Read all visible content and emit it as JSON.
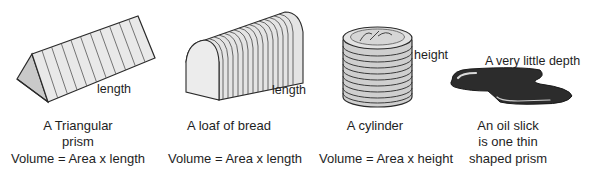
{
  "shapes": [
    {
      "id": "triangular-prism",
      "dimension_label": "length",
      "caption_lines": [
        "A Triangular",
        "prism"
      ],
      "formula": "Volume = Area x length"
    },
    {
      "id": "loaf-of-bread",
      "dimension_label": "length",
      "caption_lines": [
        "A loaf of bread"
      ],
      "formula": "Volume = Area x length"
    },
    {
      "id": "cylinder",
      "dimension_label": "height",
      "caption_lines": [
        "A cylinder"
      ],
      "formula": "Volume = Area x height"
    },
    {
      "id": "oil-slick",
      "dimension_label": "A very little depth",
      "caption_lines": [
        "An oil slick",
        "is one thin",
        "shaped prism"
      ],
      "formula": ""
    }
  ],
  "colors": {
    "outline": "#2a2a2a",
    "face_light": "#e6e6e6",
    "face_shade": "#c8c8c8",
    "slick_dark": "#2c2c2c",
    "slick_highlight": "#d9d9d9"
  }
}
